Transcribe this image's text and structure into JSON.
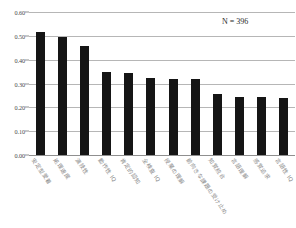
{
  "chart_data": {
    "type": "bar",
    "title": "",
    "xlabel": "",
    "ylabel": "",
    "ylim": [
      0.0,
      0.6
    ],
    "yticks": [
      "0.00",
      "0.10",
      "0.20",
      "0.30",
      "0.40",
      "0.50",
      "0.60"
    ],
    "ytick_values": [
      0.0,
      0.1,
      0.2,
      0.3,
      0.4,
      0.5,
      0.6
    ],
    "grid": true,
    "legend": "none",
    "annotation": "N = 396",
    "categories": [
      "安定型愛着",
      "処理速度",
      "演技性",
      "動作性 IQ",
      "肯定的認知",
      "全検査 IQ",
      "授業の理解",
      "前向きな課題の受け止め",
      "知覚統合",
      "言語理解",
      "感覚追求",
      "言語性 IQ"
    ],
    "values": [
      0.515,
      0.497,
      0.458,
      0.348,
      0.343,
      0.322,
      0.319,
      0.317,
      0.256,
      0.245,
      0.245,
      0.241
    ]
  },
  "title_sliver": "",
  "bar_color": "#151515",
  "grid_color": "#b6b6b6"
}
